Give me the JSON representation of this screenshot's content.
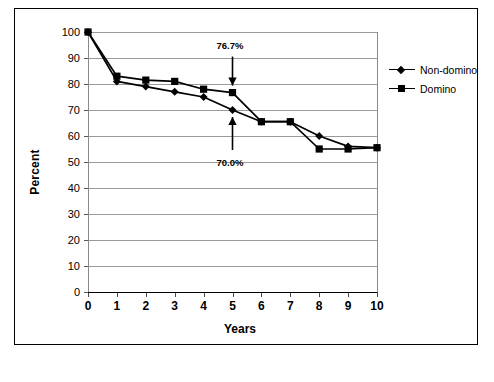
{
  "chart_data": {
    "type": "line",
    "title": "",
    "subtitle": "",
    "xlabel": "Years",
    "ylabel": "Percent",
    "x": [
      0,
      1,
      2,
      3,
      4,
      5,
      6,
      7,
      8,
      9,
      10
    ],
    "xlim": [
      0,
      10
    ],
    "ylim": [
      0,
      100
    ],
    "xticks": [
      "0",
      "1",
      "2",
      "3",
      "4",
      "5",
      "6",
      "7",
      "8",
      "9",
      "10"
    ],
    "yticks": [
      "0",
      "10",
      "20",
      "30",
      "40",
      "50",
      "60",
      "70",
      "80",
      "90",
      "100"
    ],
    "grid": "horizontal",
    "legend_position": "right",
    "series": [
      {
        "name": "Non-domino",
        "marker": "diamond",
        "color": "#000000",
        "values": [
          100,
          81,
          79,
          77,
          75,
          70.0,
          65.5,
          65.5,
          60,
          56,
          55.5
        ]
      },
      {
        "name": "Domino",
        "marker": "square",
        "color": "#000000",
        "values": [
          100,
          83,
          81.5,
          81,
          78,
          76.7,
          65.5,
          65.5,
          55,
          55,
          55.5
        ]
      }
    ],
    "annotations": [
      {
        "text": "76.7%",
        "x": 5,
        "y": 76.7,
        "series": "Domino",
        "arrow": "down"
      },
      {
        "text": "70.0%",
        "x": 5,
        "y": 70.0,
        "series": "Non-domino",
        "arrow": "up"
      }
    ]
  },
  "legend": {
    "items": [
      {
        "label": "Non-domino",
        "marker": "diamond"
      },
      {
        "label": "Domino",
        "marker": "square"
      }
    ]
  },
  "axes": {
    "x_title": "Years",
    "y_title": "Percent"
  },
  "annotations": {
    "upper": "76.7%",
    "lower": "70.0%"
  },
  "colors": {
    "series": "#000000",
    "grid": "#9a9a9a",
    "axis": "#000000",
    "frame": "#000000",
    "background": "#ffffff"
  }
}
